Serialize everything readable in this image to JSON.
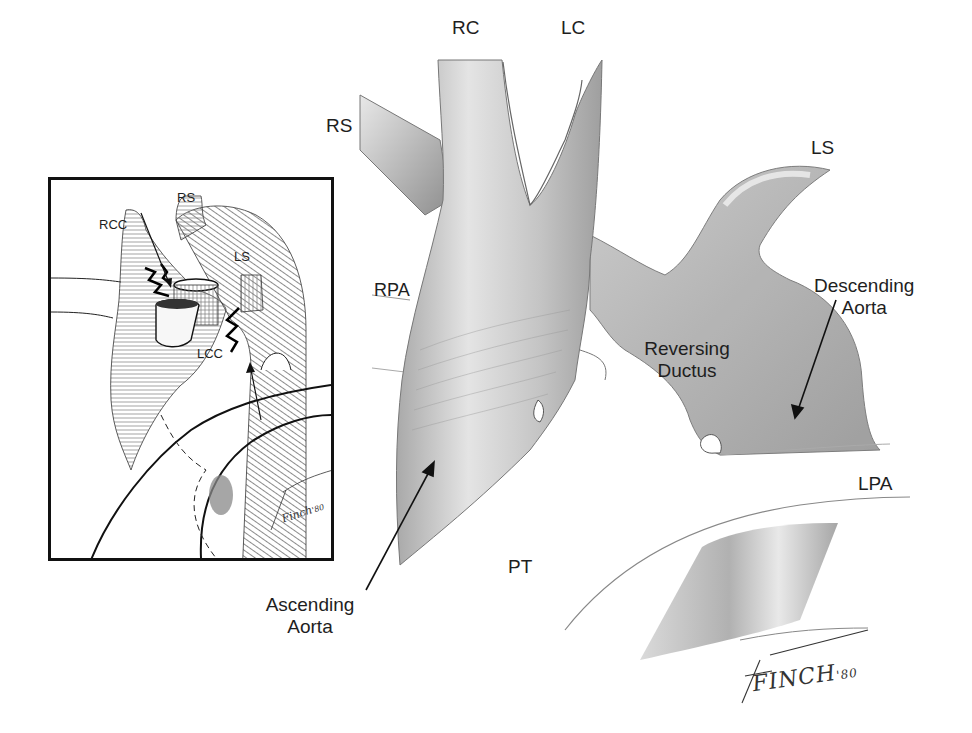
{
  "figure": {
    "type": "anatomical-illustration",
    "colors": {
      "ink": "#1e1e1e",
      "shade_dark": "#8c8c8c",
      "shade_mid": "#bdbdbd",
      "shade_light": "#e2e2e2",
      "frame": "#111111"
    }
  },
  "main": {
    "labels": {
      "rc": "RC",
      "lc": "LC",
      "rs": "RS",
      "ls": "LS",
      "rpa": "RPA",
      "reversing_ductus_line1": "Reversing",
      "reversing_ductus_line2": "Ductus",
      "descending_aorta_line1": "Descending",
      "descending_aorta_line2": "Aorta",
      "lpa": "LPA",
      "pt": "PT",
      "ascending_aorta_line1": "Ascending",
      "ascending_aorta_line2": "Aorta"
    },
    "signature": "FINCH",
    "signature_year": "'80"
  },
  "inset": {
    "labels": {
      "rs": "RS",
      "rcc": "RCC",
      "ls": "LS",
      "lcc": "LCC"
    },
    "signature": "Finch",
    "signature_year": "'80"
  }
}
